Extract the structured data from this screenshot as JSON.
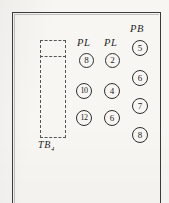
{
  "figure": {
    "kind": "engineering-schematic-fragment",
    "background_color": "#f7f6f3",
    "ink_color": "#1f1f1f",
    "frame": {
      "stroke_color": "#3a3a3a",
      "open_side": "bottom"
    }
  },
  "terminal_block": {
    "name": "TB",
    "label_text": "TB",
    "label_subscript": "4",
    "outline_style": "dashed",
    "stroke_color": "#555555"
  },
  "annotations": [
    {
      "id": "pb",
      "text": "PB",
      "meaning": "push-button"
    },
    {
      "id": "pl-left",
      "text": "PL",
      "meaning": "pilot-light"
    },
    {
      "id": "pl-right",
      "text": "PL",
      "meaning": "pilot-light"
    }
  ],
  "columns": [
    {
      "id": "column-pl-left",
      "header": "PL",
      "terminals": [
        {
          "number": "8"
        },
        {
          "number": "10"
        },
        {
          "number": "12"
        }
      ]
    },
    {
      "id": "column-pl-right",
      "header": "PL",
      "terminals": [
        {
          "number": "2"
        },
        {
          "number": "4"
        },
        {
          "number": "6"
        }
      ]
    },
    {
      "id": "column-pb",
      "header": "PB",
      "terminals": [
        {
          "number": "5"
        },
        {
          "number": "6"
        },
        {
          "number": "7"
        },
        {
          "number": "8"
        }
      ]
    }
  ]
}
